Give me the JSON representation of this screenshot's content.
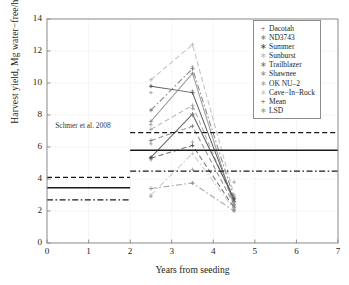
{
  "chart_data": {
    "type": "line",
    "title": "",
    "xlabel": "Years from seeding",
    "ylabel": "Harvest yield, Mg water−free/ha",
    "xlim": [
      0,
      7
    ],
    "ylim": [
      0,
      14
    ],
    "xticks": [
      "0",
      "1",
      "2",
      "3",
      "4",
      "5",
      "6",
      "7"
    ],
    "yticks": [
      "0",
      "2",
      "4",
      "6",
      "8",
      "10",
      "12",
      "14"
    ],
    "grid": true,
    "legend_position": "top-right",
    "x": [
      2.5,
      3.5,
      4.5
    ],
    "annotations": [
      {
        "text": "Schmer et al. 2008",
        "x": 0.15,
        "y": 7.3
      }
    ],
    "reference_lines": [
      {
        "name": "Schmer mean",
        "style": "solid",
        "value": 3.45,
        "x_from": 0,
        "x_to": 2
      },
      {
        "name": "Schmer upper",
        "style": "dashed",
        "value": 4.1,
        "x_from": 0,
        "x_to": 2
      },
      {
        "name": "Schmer lower",
        "style": "dashdot",
        "value": 2.7,
        "x_from": 0,
        "x_to": 2
      },
      {
        "name": "Trial mean",
        "style": "solid",
        "value": 5.8,
        "x_from": 2,
        "x_to": 7
      },
      {
        "name": "Trial upper",
        "style": "dashed",
        "value": 6.9,
        "x_from": 2,
        "x_to": 7
      },
      {
        "name": "Trial lower",
        "style": "dashdot",
        "value": 4.5,
        "x_from": 2,
        "x_to": 7
      }
    ],
    "series": [
      {
        "name": "Dacotah",
        "marker": "+",
        "color": "#555555",
        "style": "dashed",
        "values": [
          5.3,
          6.1,
          2.2
        ]
      },
      {
        "name": "ND3743",
        "marker": "∗",
        "color": "#777777",
        "style": "dashed",
        "values": [
          6.4,
          7.3,
          2.4
        ]
      },
      {
        "name": "Summer",
        "marker": "∗",
        "color": "#3d3d3d",
        "style": "solid",
        "values": [
          9.8,
          9.4,
          2.6
        ]
      },
      {
        "name": "Sunburst",
        "marker": "∗",
        "color": "#b4b4b4",
        "style": "dashed",
        "values": [
          10.2,
          12.4,
          3.0
        ]
      },
      {
        "name": "Trailblazer",
        "marker": "∗",
        "color": "#6e6e6e",
        "style": "dashdot",
        "values": [
          8.3,
          10.9,
          2.8
        ]
      },
      {
        "name": "Shawnee",
        "marker": "∗",
        "color": "#8a8a8a",
        "style": "solid",
        "values": [
          7.6,
          10.6,
          2.3
        ]
      },
      {
        "name": "OK NU–2",
        "marker": "∗",
        "color": "#9e9e9e",
        "style": "dashed",
        "values": [
          7.1,
          8.6,
          2.5
        ]
      },
      {
        "name": "Cave−In−Rock",
        "marker": "∗",
        "color": "#c2c2c2",
        "style": "dashdot",
        "values": [
          3.0,
          5.6,
          2.1
        ]
      },
      {
        "name": "Mean",
        "marker": "+",
        "color": "#444444",
        "style": "solid",
        "values": [
          5.35,
          8.05,
          2.75
        ]
      },
      {
        "name": "LSD",
        "marker": "∗",
        "color": "#8f8f8f",
        "style": "dashdot",
        "values": [
          3.4,
          3.75,
          2.0
        ]
      }
    ],
    "extra_points": [
      {
        "x": 2.5,
        "y": 9.4
      },
      {
        "x": 2.5,
        "y": 7.4
      },
      {
        "x": 2.5,
        "y": 6.2
      },
      {
        "x": 2.5,
        "y": 5.2
      },
      {
        "x": 2.5,
        "y": 2.9
      },
      {
        "x": 3.5,
        "y": 11.0
      },
      {
        "x": 3.5,
        "y": 9.5
      },
      {
        "x": 3.5,
        "y": 8.4
      },
      {
        "x": 3.5,
        "y": 8.0
      },
      {
        "x": 3.5,
        "y": 6.3
      },
      {
        "x": 3.5,
        "y": 4.6
      },
      {
        "x": 4.5,
        "y": 3.8
      },
      {
        "x": 4.5,
        "y": 2.9
      },
      {
        "x": 4.5,
        "y": 2.05
      }
    ]
  },
  "legend": {
    "items": [
      {
        "marker": "+",
        "label": "Dacotah"
      },
      {
        "marker": "∗",
        "label": "ND3743"
      },
      {
        "marker": "∗",
        "label": "Summer"
      },
      {
        "marker": "∗",
        "label": "Sunburst"
      },
      {
        "marker": "∗",
        "label": "Trailblazer"
      },
      {
        "marker": "∗",
        "label": "Shawnee"
      },
      {
        "marker": "∗",
        "label": "OK NU–2"
      },
      {
        "marker": "∗",
        "label": "Cave−In−Rock"
      },
      {
        "marker": "+",
        "label": "Mean"
      },
      {
        "marker": "∗",
        "label": "LSD"
      }
    ]
  },
  "colors": {
    "axis": "#8d8d8d",
    "grid": "#dcdcdc",
    "text": "#231f20",
    "reference": "#1a1a1a",
    "background": "#ffffff"
  }
}
